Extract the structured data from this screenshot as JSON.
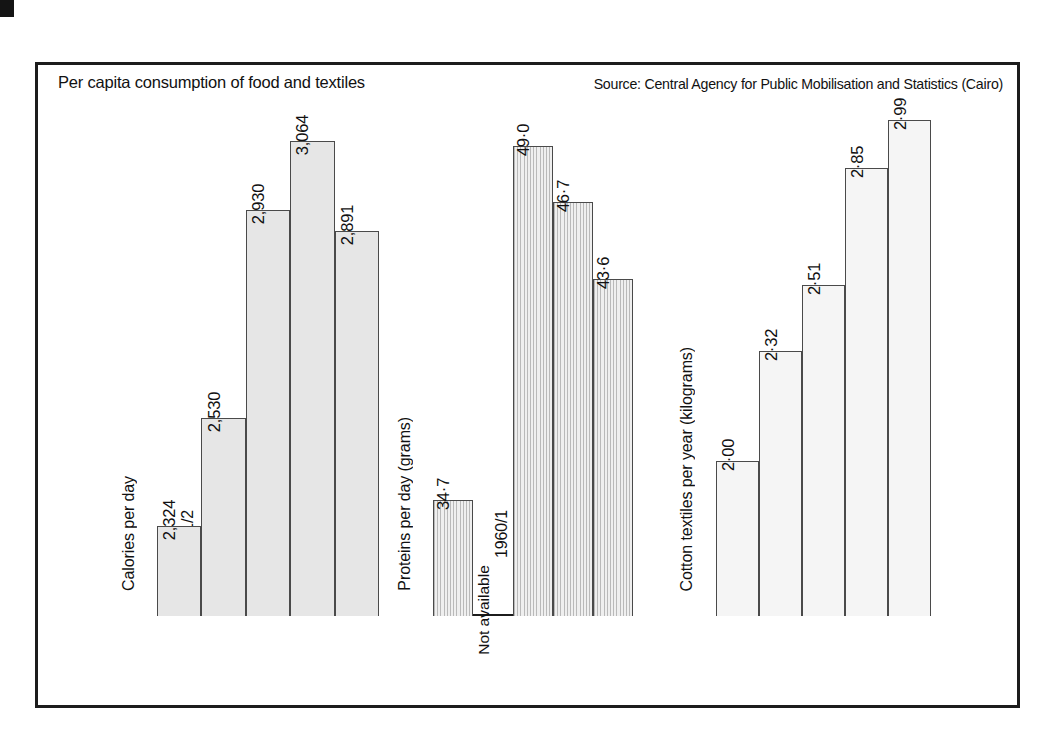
{
  "caption": {
    "title": "Per capita consumption of food and textiles",
    "source": "Source: Central Agency for Public Mobilisation and Statistics (Cairo)"
  },
  "colors": {
    "frame": "#1c1c1c",
    "bar_outline": "#4a4a4a",
    "fill_calories": "#e6e6e6",
    "fill_proteins": "#cfcfcf",
    "fill_textiles": "#f5f5f5",
    "text": "#111111"
  },
  "chart_data": [
    {
      "type": "bar",
      "title": "Calories per day",
      "ylabel": "Calories per day",
      "xlabel": "",
      "categories": [
        "1951/2",
        "1960/1",
        "1963/4",
        "1966/7",
        "1968/9"
      ],
      "values": [
        2324,
        2530,
        2930,
        3064,
        2891
      ],
      "labels": [
        "2,324",
        "2,530",
        "2,930",
        "3,064",
        "2,891"
      ],
      "ylim": [
        2150,
        3150
      ],
      "grid": false,
      "legend": "none",
      "fill": "solid-grey"
    },
    {
      "type": "bar",
      "title": "Proteins per day (grams)",
      "ylabel": "Proteins per day (grams)",
      "xlabel": "",
      "categories": [
        "1951/2",
        "1960/1",
        "1963/4",
        "1966/7",
        "1968/9"
      ],
      "values": [
        34.7,
        null,
        49.0,
        46.7,
        43.6
      ],
      "labels": [
        "34·7",
        "Not available",
        "49·0",
        "46·7",
        "43·6"
      ],
      "missing_label": "Not available",
      "ylim": [
        30,
        51
      ],
      "grid": false,
      "legend": "none",
      "fill": "vertical-hatch"
    },
    {
      "type": "bar",
      "title": "Cotton textiles per year (kilograms)",
      "ylabel": "Cotton textiles per year (kilograms)",
      "xlabel": "",
      "categories": [
        "1951/2",
        "1960/1",
        "1963/4",
        "1966/7",
        "1968/9"
      ],
      "values": [
        2.0,
        2.32,
        2.51,
        2.85,
        2.99
      ],
      "labels": [
        "2·00",
        "2·32",
        "2·51",
        "2·85",
        "2·99"
      ],
      "ylim": [
        1.55,
        3.06
      ],
      "grid": false,
      "legend": "none",
      "fill": "light-grey"
    }
  ]
}
